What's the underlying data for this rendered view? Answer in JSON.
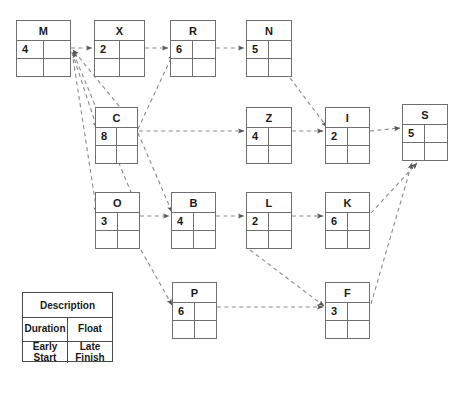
{
  "diagram": {
    "caption": "",
    "edge_color": "#8a8a8a",
    "box_border_color": "#6f6f6f",
    "text_color": "#1a1a1a",
    "background": "#ffffff"
  },
  "nodes": [
    {
      "id": "M",
      "label": "M",
      "duration": "4",
      "float": "",
      "early_start": "",
      "late_finish": "",
      "x": 16,
      "y": 20,
      "w": 55,
      "h": 57
    },
    {
      "id": "X",
      "label": "X",
      "duration": "2",
      "float": "",
      "early_start": "",
      "late_finish": "",
      "x": 94,
      "y": 20,
      "w": 51,
      "h": 57
    },
    {
      "id": "R",
      "label": "R",
      "duration": "6",
      "float": "",
      "early_start": "",
      "late_finish": "",
      "x": 170,
      "y": 20,
      "w": 46,
      "h": 57
    },
    {
      "id": "N",
      "label": "N",
      "duration": "5",
      "float": "",
      "early_start": "",
      "late_finish": "",
      "x": 246,
      "y": 20,
      "w": 46,
      "h": 57
    },
    {
      "id": "C",
      "label": "C",
      "duration": "8",
      "float": "",
      "early_start": "",
      "late_finish": "",
      "x": 95,
      "y": 107,
      "w": 43,
      "h": 57
    },
    {
      "id": "Z",
      "label": "Z",
      "duration": "4",
      "float": "",
      "early_start": "",
      "late_finish": "",
      "x": 246,
      "y": 107,
      "w": 46,
      "h": 57
    },
    {
      "id": "I",
      "label": "I",
      "duration": "2",
      "float": "",
      "early_start": "",
      "late_finish": "",
      "x": 325,
      "y": 107,
      "w": 45,
      "h": 57
    },
    {
      "id": "S",
      "label": "S",
      "duration": "5",
      "float": "",
      "early_start": "",
      "late_finish": "",
      "x": 402,
      "y": 104,
      "w": 46,
      "h": 57
    },
    {
      "id": "O",
      "label": "O",
      "duration": "3",
      "float": "",
      "early_start": "",
      "late_finish": "",
      "x": 95,
      "y": 192,
      "w": 45,
      "h": 57
    },
    {
      "id": "B",
      "label": "B",
      "duration": "4",
      "float": "",
      "early_start": "",
      "late_finish": "",
      "x": 171,
      "y": 192,
      "w": 45,
      "h": 57
    },
    {
      "id": "L",
      "label": "L",
      "duration": "2",
      "float": "",
      "early_start": "",
      "late_finish": "",
      "x": 246,
      "y": 192,
      "w": 46,
      "h": 57
    },
    {
      "id": "K",
      "label": "K",
      "duration": "6",
      "float": "",
      "early_start": "",
      "late_finish": "",
      "x": 325,
      "y": 192,
      "w": 45,
      "h": 57
    },
    {
      "id": "P",
      "label": "P",
      "duration": "6",
      "float": "",
      "early_start": "",
      "late_finish": "",
      "x": 172,
      "y": 282,
      "w": 45,
      "h": 57
    },
    {
      "id": "F",
      "label": "F",
      "duration": "3",
      "float": "",
      "early_start": "",
      "late_finish": "",
      "x": 325,
      "y": 282,
      "w": 45,
      "h": 57
    }
  ],
  "edges": [
    {
      "from": "M",
      "to": "X",
      "x1": 71,
      "y1": 48,
      "x2": 92,
      "y2": 48
    },
    {
      "from": "X",
      "to": "R",
      "x1": 145,
      "y1": 48,
      "x2": 168,
      "y2": 48
    },
    {
      "from": "R",
      "to": "N",
      "x1": 216,
      "y1": 48,
      "x2": 244,
      "y2": 48
    },
    {
      "from": "C",
      "to": "M",
      "x1": 138,
      "y1": 129,
      "x2": 73,
      "y2": 50
    },
    {
      "from": "O",
      "to": "M",
      "x1": 140,
      "y1": 214,
      "x2": 73,
      "y2": 52
    },
    {
      "from": "C",
      "to": "R",
      "x1": 138,
      "y1": 129,
      "x2": 173,
      "y2": 54
    },
    {
      "from": "M",
      "to": "C",
      "x1": 72,
      "y1": 52,
      "x2": 97,
      "y2": 128
    },
    {
      "from": "M",
      "to": "O",
      "x1": 72,
      "y1": 52,
      "x2": 97,
      "y2": 213
    },
    {
      "from": "C",
      "to": "Z",
      "x1": 139,
      "y1": 131,
      "x2": 244,
      "y2": 131
    },
    {
      "from": "Z",
      "to": "I",
      "x1": 292,
      "y1": 131,
      "x2": 323,
      "y2": 131
    },
    {
      "from": "N",
      "to": "I",
      "x1": 290,
      "y1": 78,
      "x2": 327,
      "y2": 127
    },
    {
      "from": "I",
      "to": "S",
      "x1": 370,
      "y1": 131,
      "x2": 400,
      "y2": 128
    },
    {
      "from": "O",
      "to": "B",
      "x1": 140,
      "y1": 216,
      "x2": 169,
      "y2": 216
    },
    {
      "from": "C",
      "to": "B",
      "x1": 138,
      "y1": 133,
      "x2": 172,
      "y2": 212
    },
    {
      "from": "B",
      "to": "L",
      "x1": 216,
      "y1": 216,
      "x2": 244,
      "y2": 216
    },
    {
      "from": "L",
      "to": "K",
      "x1": 292,
      "y1": 216,
      "x2": 323,
      "y2": 216
    },
    {
      "from": "L",
      "to": "F",
      "x1": 250,
      "y1": 250,
      "x2": 324,
      "y2": 306
    },
    {
      "from": "O",
      "to": "P",
      "x1": 141,
      "y1": 250,
      "x2": 172,
      "y2": 305
    },
    {
      "from": "P",
      "to": "F",
      "x1": 217,
      "y1": 307,
      "x2": 323,
      "y2": 307
    },
    {
      "from": "K",
      "to": "S",
      "x1": 371,
      "y1": 213,
      "x2": 417,
      "y2": 163
    },
    {
      "from": "F",
      "to": "S",
      "x1": 371,
      "y1": 304,
      "x2": 412,
      "y2": 163
    }
  ],
  "legend": {
    "x": 22,
    "y": 292,
    "w": 91,
    "h": 70,
    "title": "Description",
    "row_middle": [
      "Duration",
      "Float"
    ],
    "row_bottom": [
      {
        "line1": "Early",
        "line2": "Start"
      },
      {
        "line1": "Late",
        "line2": "Finish"
      }
    ]
  }
}
